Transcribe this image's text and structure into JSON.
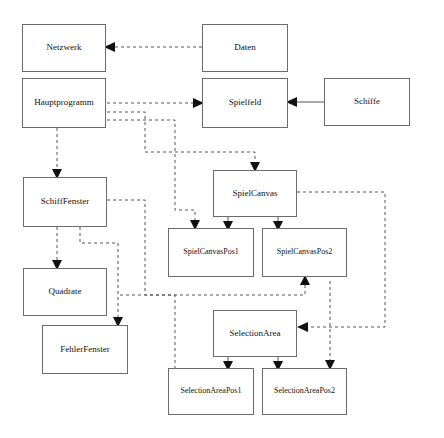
{
  "diagram": {
    "type": "class-dependency-diagram",
    "title": "",
    "language": "de",
    "background_color": "#ffffff",
    "box_border_color": "#6b6b6b",
    "edge_color": "#555555",
    "text_color": "#111111",
    "nodes": [
      {
        "id": "netzwerk",
        "label": "Netzwerk",
        "x": 22,
        "y": 24,
        "w": 84,
        "h": 48,
        "font_size": 9
      },
      {
        "id": "daten",
        "label": "Daten",
        "x": 202,
        "y": 24,
        "w": 86,
        "h": 48,
        "font_size": 9
      },
      {
        "id": "hauptprogramm",
        "label": "Hauptprogramm",
        "x": 22,
        "y": 78,
        "w": 84,
        "h": 50,
        "font_size": 9
      },
      {
        "id": "spielfeld",
        "label": "Spielfeld",
        "x": 202,
        "y": 78,
        "w": 86,
        "h": 50,
        "font_size": 9
      },
      {
        "id": "schiffe",
        "label": "Schiffe",
        "x": 324,
        "y": 78,
        "w": 86,
        "h": 48,
        "font_size": 9
      },
      {
        "id": "schifffenster",
        "label": "SchiffFenster",
        "x": 23,
        "y": 177,
        "w": 84,
        "h": 50,
        "font_size": 9
      },
      {
        "id": "spielcanvas",
        "label": "SpielCanvas",
        "x": 213,
        "y": 170,
        "w": 84,
        "h": 47,
        "font_size": 9
      },
      {
        "id": "spielcanvaspos1",
        "label": "SpielCanvasPos1",
        "x": 168,
        "y": 228,
        "w": 86,
        "h": 49,
        "font_size": 8
      },
      {
        "id": "spielcanvaspos2",
        "label": "SpielCanvasPos2",
        "x": 262,
        "y": 228,
        "w": 85,
        "h": 49,
        "font_size": 8
      },
      {
        "id": "quadrate",
        "label": "Quadrate",
        "x": 23,
        "y": 268,
        "w": 84,
        "h": 48,
        "font_size": 9
      },
      {
        "id": "selectionarea",
        "label": "SelectionArea",
        "x": 213,
        "y": 310,
        "w": 84,
        "h": 47,
        "font_size": 9
      },
      {
        "id": "fehlerfenster",
        "label": "FehlerFenster",
        "x": 42,
        "y": 325,
        "w": 86,
        "h": 49,
        "font_size": 9
      },
      {
        "id": "selectionareapos1",
        "label": "SelectionAreaPos1",
        "x": 168,
        "y": 368,
        "w": 86,
        "h": 47,
        "font_size": 8
      },
      {
        "id": "selectionareapos2",
        "label": "SelectionAreaPos2",
        "x": 262,
        "y": 368,
        "w": 85,
        "h": 47,
        "font_size": 8
      }
    ],
    "edges": [
      {
        "id": "daten-to-netzwerk",
        "from": "daten",
        "to": "netzwerk",
        "style": "dashed",
        "points": [
          [
            202,
            47
          ],
          [
            110,
            47
          ]
        ],
        "arrow": "left"
      },
      {
        "id": "hauptprogramm-to-spielfeld",
        "from": "hauptprogramm",
        "to": "spielfeld",
        "style": "dashed",
        "points": [
          [
            107,
            103
          ],
          [
            198,
            103
          ]
        ],
        "arrow": "right"
      },
      {
        "id": "schiffe-to-spielfeld",
        "from": "schiffe",
        "to": "spielfeld",
        "style": "solid",
        "points": [
          [
            324,
            102
          ],
          [
            292,
            102
          ]
        ],
        "arrow": "left"
      },
      {
        "id": "hauptprogramm-to-schifffenster",
        "from": "hauptprogramm",
        "to": "schifffenster",
        "style": "dashed",
        "points": [
          [
            57,
            128
          ],
          [
            57,
            173
          ]
        ],
        "arrow": "down"
      },
      {
        "id": "hauptprogramm-to-spielcanvas",
        "from": "hauptprogramm",
        "to": "spielcanvas",
        "style": "dashed",
        "points": [
          [
            107,
            112
          ],
          [
            145,
            112
          ],
          [
            145,
            152
          ],
          [
            255,
            152
          ],
          [
            255,
            166
          ]
        ],
        "arrow": "down"
      },
      {
        "id": "hauptprogramm-to-spielcanvaspos1",
        "from": "hauptprogramm",
        "to": "spielcanvaspos1",
        "style": "dashed",
        "points": [
          [
            107,
            120
          ],
          [
            175,
            120
          ],
          [
            175,
            210
          ],
          [
            195,
            210
          ],
          [
            195,
            224
          ]
        ],
        "arrow": "down"
      },
      {
        "id": "schifffenster-to-spielcanvaspos1",
        "from": "schifffenster",
        "to": "spielcanvaspos1",
        "style": "dashed",
        "points": [
          [
            107,
            200
          ],
          [
            145,
            200
          ],
          [
            145,
            295
          ],
          [
            175,
            295
          ],
          [
            175,
            380
          ]
        ],
        "arrow": "down"
      },
      {
        "id": "schifffenster-to-quadrate",
        "from": "schifffenster",
        "to": "quadrate",
        "style": "dashed",
        "points": [
          [
            57,
            227
          ],
          [
            57,
            264
          ]
        ],
        "arrow": "down"
      },
      {
        "id": "schifffenster-to-fehlerfenster",
        "from": "schifffenster",
        "to": "fehlerfenster",
        "style": "dashed",
        "points": [
          [
            80,
            227
          ],
          [
            80,
            243
          ],
          [
            118,
            243
          ],
          [
            118,
            321
          ]
        ],
        "arrow": "down"
      },
      {
        "id": "spielcanvas-to-spielcanvaspos1",
        "from": "spielcanvas",
        "to": "spielcanvaspos1",
        "style": "solid",
        "points": [
          [
            228,
            217
          ],
          [
            228,
            225
          ]
        ],
        "arrow": "down"
      },
      {
        "id": "spielcanvas-to-spielcanvaspos2",
        "from": "spielcanvas",
        "to": "spielcanvaspos2",
        "style": "solid",
        "points": [
          [
            278,
            217
          ],
          [
            278,
            225
          ]
        ],
        "arrow": "down"
      },
      {
        "id": "spielcanvas-to-selectionarea",
        "from": "spielcanvas",
        "to": "selectionarea",
        "style": "dashed",
        "points": [
          [
            297,
            192
          ],
          [
            385,
            192
          ],
          [
            385,
            327
          ],
          [
            303,
            327
          ]
        ],
        "arrow": "left"
      },
      {
        "id": "selectionarea-to-selectionareapos1",
        "from": "selectionarea",
        "to": "selectionareapos1",
        "style": "solid",
        "points": [
          [
            228,
            357
          ],
          [
            228,
            365
          ]
        ],
        "arrow": "down"
      },
      {
        "id": "selectionarea-to-selectionareapos2",
        "from": "selectionarea",
        "to": "selectionareapos2",
        "style": "solid",
        "points": [
          [
            278,
            357
          ],
          [
            278,
            365
          ]
        ],
        "arrow": "down"
      },
      {
        "id": "selectionarea-to-spielcanvaspos2",
        "from": "selectionarea",
        "to": "spielcanvaspos2",
        "style": "dashed",
        "points": [
          [
            120,
            295
          ],
          [
            305,
            295
          ],
          [
            305,
            281
          ]
        ],
        "arrow": "up"
      },
      {
        "id": "right-rail-to-selectionareapos2",
        "from": "spielcanvas",
        "to": "selectionareapos2",
        "style": "dashed",
        "points": [
          [
            330,
            281
          ],
          [
            330,
            364
          ]
        ],
        "arrow": "down"
      }
    ]
  }
}
